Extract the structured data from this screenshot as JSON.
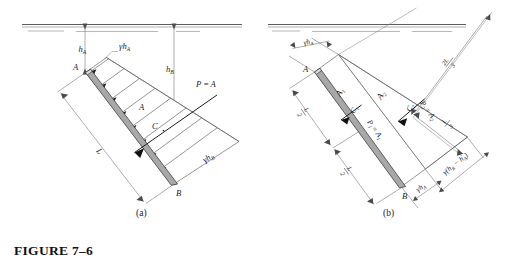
{
  "figure": {
    "caption": "FIGURE 7–6",
    "panels": [
      {
        "key": "a",
        "label": "(a)"
      },
      {
        "key": "b",
        "label": "(b)"
      }
    ]
  },
  "panel_a": {
    "points": {
      "A": "A",
      "B": "B",
      "C": "C"
    },
    "depth_labels": {
      "hA": "h",
      "hA_sub": "A",
      "hB": "h",
      "hB_sub": "B"
    },
    "pressure_labels": {
      "top": "γh",
      "top_sub": "A",
      "bottom": "γh",
      "bottom_sub": "B"
    },
    "area_label": "A",
    "resultant": {
      "text": "P =",
      "area": "A"
    },
    "length_label": "L"
  },
  "panel_b": {
    "points": {
      "A": "A",
      "B": "B",
      "C1": "C",
      "C1_sub": "1",
      "C2": "C",
      "C2_sub": "2"
    },
    "areas": {
      "A1": "A",
      "A1_sub": "1",
      "A2": "A",
      "A2_sub": "2"
    },
    "resultants": {
      "P1": "P",
      "P1_sub": "1",
      "P1_eq": "= A",
      "P1_eq_sub": "1",
      "P2": "P",
      "P2_sub": "2",
      "P2_eq": "= A",
      "P2_eq_sub": "2"
    },
    "pressure_labels": {
      "top_gamma_hA": "γh",
      "top_gamma_hA_sub": "A",
      "bottom_gamma_hA": "γh",
      "bottom_gamma_hA_sub": "A",
      "gamma_delta": "γ(h",
      "gamma_delta_sub1": "B",
      "gamma_delta_mid": " − h",
      "gamma_delta_sub2": "A",
      "gamma_delta_end": ")"
    },
    "dimensions": {
      "L_over_2_upper_num": "L",
      "L_over_2_upper_den": "2",
      "L_over_2_lower_num": "L",
      "L_over_2_lower_den": "2",
      "two_L_over_3_num": "2L",
      "two_L_over_3_den": "3",
      "L_over_3_num": "L",
      "L_over_3_den": "3"
    }
  },
  "colors": {
    "plate_fill": "#a8a8a8",
    "line": "#5d5d5d",
    "force": "#1c1c1c",
    "background": "#ffffff"
  }
}
